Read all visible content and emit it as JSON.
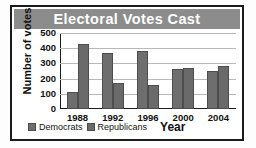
{
  "chart_data": {
    "type": "bar",
    "title": "Electoral Votes Cast",
    "xlabel": "Year",
    "ylabel": "Number of votes",
    "categories": [
      "1988",
      "1992",
      "1996",
      "2000",
      "2004"
    ],
    "series": [
      {
        "name": "Democrats",
        "values": [
          111,
          370,
          379,
          266,
          251
        ],
        "color": "#6e6e6e"
      },
      {
        "name": "Republicans",
        "values": [
          426,
          168,
          159,
          271,
          286
        ],
        "color": "#6a6a6a"
      }
    ],
    "ylim": [
      0,
      500
    ],
    "yticks": [
      0,
      100,
      200,
      300,
      400,
      500
    ],
    "ytick_labels": [
      "0",
      "100",
      "200",
      "300",
      "400",
      "500"
    ],
    "grid": true,
    "legend_position": "bottom-left",
    "title_bar_color": "#8c8c8c",
    "title_text_color": "#ffffff",
    "border_color": "#1b1b1b",
    "plot_background": "#ffffff",
    "gridline_color": "#b9b9b9"
  }
}
